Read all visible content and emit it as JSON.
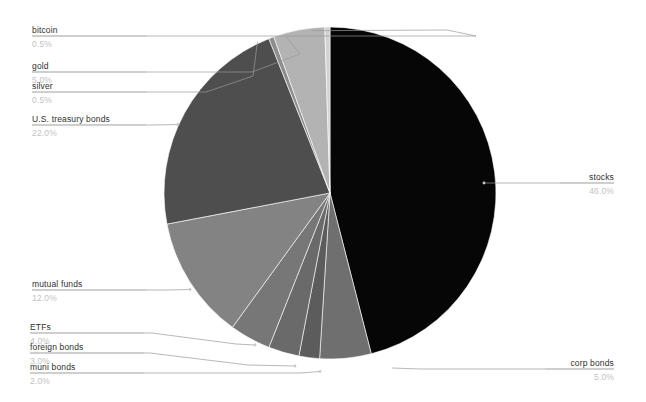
{
  "chart_data": {
    "type": "pie",
    "title": "",
    "subtitle": "",
    "xlabel": "",
    "ylabel": "",
    "legend_position": "labels-with-leader-lines",
    "grid": false,
    "start_angle_deg": 0,
    "direction": "clockwise",
    "units": "percent",
    "total": 100.0,
    "categories": [
      "stocks",
      "corp bonds",
      "muni bonds",
      "foreign bonds",
      "ETFs",
      "mutual funds",
      "U.S. treasury bonds",
      "silver",
      "gold",
      "bitcoin"
    ],
    "values": [
      46.0,
      5.0,
      2.0,
      3.0,
      4.0,
      12.0,
      22.0,
      0.5,
      5.0,
      0.5
    ],
    "slices": [
      {
        "label": "stocks",
        "value": 46.0,
        "pct_text": "46.0%",
        "color": "#060606",
        "side": "right"
      },
      {
        "label": "corp bonds",
        "value": 5.0,
        "pct_text": "5.0%",
        "color": "#6f6f6f",
        "side": "right"
      },
      {
        "label": "muni bonds",
        "value": 2.0,
        "pct_text": "2.0%",
        "color": "#5c5c5c",
        "side": "left"
      },
      {
        "label": "foreign bonds",
        "value": 3.0,
        "pct_text": "3.0%",
        "color": "#6a6a6a",
        "side": "left"
      },
      {
        "label": "ETFs",
        "value": 4.0,
        "pct_text": "4.0%",
        "color": "#777777",
        "side": "left"
      },
      {
        "label": "mutual funds",
        "value": 12.0,
        "pct_text": "12.0%",
        "color": "#838383",
        "side": "left"
      },
      {
        "label": "U.S. treasury bonds",
        "value": 22.0,
        "pct_text": "22.0%",
        "color": "#4e4e4e",
        "side": "left"
      },
      {
        "label": "silver",
        "value": 0.5,
        "pct_text": "0.5%",
        "color": "#8d8d8d",
        "side": "left"
      },
      {
        "label": "gold",
        "value": 5.0,
        "pct_text": "5.0%",
        "color": "#b3b3b3",
        "side": "left"
      },
      {
        "label": "bitcoin",
        "value": 0.5,
        "pct_text": "0.5%",
        "color": "#d2d2d2",
        "side": "left"
      }
    ],
    "colors": {
      "background": "#ffffff",
      "label_text": "#2f2f2f",
      "pct_text": "#c2c2c2",
      "leader_line": "#9a9a9a",
      "label_rule": "#b9b9b9"
    }
  },
  "labels": {
    "bitcoin": {
      "name": "bitcoin",
      "pct": "0.5%"
    },
    "gold": {
      "name": "gold",
      "pct": "5.0%"
    },
    "silver": {
      "name": "silver",
      "pct": "0.5%"
    },
    "treasury": {
      "name": "U.S. treasury bonds",
      "pct": "22.0%"
    },
    "mutual": {
      "name": "mutual funds",
      "pct": "12.0%"
    },
    "etfs": {
      "name": "ETFs",
      "pct": "4.0%"
    },
    "foreign": {
      "name": "foreign bonds",
      "pct": "3.0%"
    },
    "muni": {
      "name": "muni bonds",
      "pct": "2.0%"
    },
    "stocks": {
      "name": "stocks",
      "pct": "46.0%"
    },
    "corp": {
      "name": "corp bonds",
      "pct": "5.0%"
    }
  }
}
